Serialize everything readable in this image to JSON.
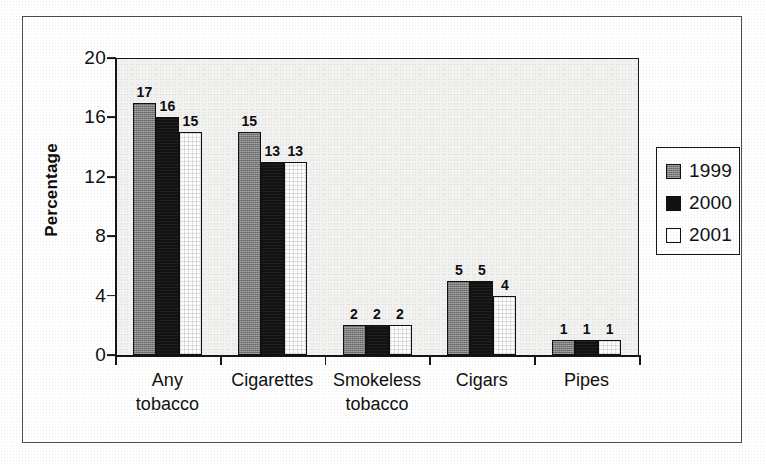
{
  "chart_data": {
    "type": "bar",
    "title": "",
    "subtitle": "",
    "xlabel": "",
    "ylabel": "Percentage",
    "ylim": [
      0,
      20
    ],
    "yticks": [
      0,
      4,
      8,
      12,
      16,
      20
    ],
    "ytick_labels": [
      "0",
      "4",
      "8",
      "12",
      "16",
      "20"
    ],
    "grid": false,
    "legend_position": "right",
    "categories": [
      "Any\ntobacco",
      "Cigarettes",
      "Smokeless\ntobacco",
      "Cigars",
      "Pipes"
    ],
    "category_lines": [
      [
        "Any",
        "tobacco"
      ],
      [
        "Cigarettes",
        ""
      ],
      [
        "Smokeless",
        "tobacco"
      ],
      [
        "Cigars",
        ""
      ],
      [
        "Pipes",
        ""
      ]
    ],
    "series": [
      {
        "name": "1999",
        "color": "#7d7d7d",
        "values": [
          17,
          15,
          2,
          5,
          1
        ]
      },
      {
        "name": "2000",
        "color": "#121212",
        "values": [
          16,
          13,
          2,
          5,
          1
        ]
      },
      {
        "name": "2001",
        "color": "#ffffff",
        "values": [
          15,
          13,
          2,
          4,
          1
        ]
      }
    ],
    "data_labels": [
      [
        "17",
        "16",
        "15"
      ],
      [
        "15",
        "13",
        "13"
      ],
      [
        "2",
        "2",
        "2"
      ],
      [
        "5",
        "5",
        "4"
      ],
      [
        "1",
        "1",
        "1"
      ]
    ]
  },
  "legend": {
    "items": [
      {
        "label": "1999",
        "swatch": "gray-swatch-icon"
      },
      {
        "label": "2000",
        "swatch": "black-swatch-icon"
      },
      {
        "label": "2001",
        "swatch": "white-swatch-icon"
      }
    ]
  },
  "axis": {
    "y_title": "Percentage",
    "y_tick_labels": [
      "20",
      "16",
      "12",
      "8",
      "4",
      "0"
    ]
  },
  "colors": {
    "series_1999": "#7d7d7d",
    "series_2000": "#121212",
    "series_2001": "#ffffff",
    "axis": "#151515",
    "plot_background": "#f2f2f0",
    "frame": "#4d4d4d"
  }
}
